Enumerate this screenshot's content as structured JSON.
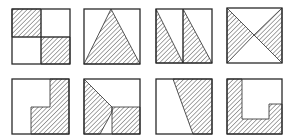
{
  "diagram": {
    "colors": {
      "stroke": "#2a2a2a",
      "hatch": "#3a3a3a",
      "background": "#ffffff"
    },
    "figures": [
      {
        "id": 1,
        "row": 1,
        "col": 1,
        "box": [
          12,
          9,
          58,
          55
        ],
        "shaded": [
          [
            [
              12,
              9
            ],
            [
              41,
              9
            ],
            [
              41,
              37
            ],
            [
              12,
              37
            ]
          ],
          [
            [
              41,
              37
            ],
            [
              70,
              37
            ],
            [
              70,
              64
            ],
            [
              41,
              64
            ]
          ]
        ],
        "lines": [
          [
            [
              41,
              9
            ],
            [
              41,
              64
            ]
          ],
          [
            [
              12,
              37
            ],
            [
              70,
              37
            ]
          ]
        ]
      },
      {
        "id": 2,
        "row": 1,
        "col": 2,
        "box": [
          84,
          9,
          56,
          55
        ],
        "shaded": [
          [
            [
              111,
              9
            ],
            [
              140,
              64
            ],
            [
              84,
              64
            ]
          ]
        ],
        "lines": []
      },
      {
        "id": 3,
        "row": 1,
        "col": 3,
        "box": [
          156,
          9,
          56,
          54
        ],
        "shaded": [
          [
            [
              156,
              9
            ],
            [
              183,
              63
            ],
            [
              156,
              63
            ]
          ],
          [
            [
              183,
              9
            ],
            [
              212,
              63
            ],
            [
              183,
              63
            ]
          ]
        ],
        "lines": [
          [
            [
              183,
              9
            ],
            [
              183,
              63
            ]
          ]
        ]
      },
      {
        "id": 4,
        "row": 1,
        "col": 4,
        "box": [
          227,
          8,
          55,
          55
        ],
        "shaded": [
          [
            [
              227,
              8
            ],
            [
              254,
              35
            ],
            [
              227,
              63
            ]
          ],
          [
            [
              282,
              8
            ],
            [
              282,
              63
            ],
            [
              254,
              35
            ]
          ]
        ],
        "lines": []
      },
      {
        "id": 5,
        "row": 2,
        "col": 1,
        "box": [
          12,
          79,
          57,
          55
        ],
        "shaded": [
          [
            [
              50,
              79
            ],
            [
              69,
              79
            ],
            [
              69,
              134
            ],
            [
              31,
              134
            ],
            [
              31,
              107
            ],
            [
              50,
              107
            ]
          ]
        ],
        "lines": []
      },
      {
        "id": 6,
        "row": 2,
        "col": 2,
        "box": [
          84,
          79,
          56,
          55
        ],
        "shaded": [
          [
            [
              84,
              79
            ],
            [
              112,
              107
            ],
            [
              112,
              112
            ],
            [
              100,
              134
            ],
            [
              84,
              134
            ]
          ],
          [
            [
              112,
              107
            ],
            [
              140,
              107
            ],
            [
              140,
              134
            ],
            [
              112,
              134
            ]
          ]
        ],
        "lines": []
      },
      {
        "id": 7,
        "row": 2,
        "col": 3,
        "box": [
          156,
          79,
          56,
          55
        ],
        "shaded": [
          [
            [
              173,
              79
            ],
            [
              212,
              79
            ],
            [
              212,
              134
            ],
            [
              193,
              134
            ]
          ]
        ],
        "lines": []
      },
      {
        "id": 8,
        "row": 2,
        "col": 4,
        "box": [
          227,
          79,
          55,
          55
        ],
        "shaded": [
          [
            [
              227,
              79
            ],
            [
              242,
              79
            ],
            [
              242,
              119
            ],
            [
              269,
              119
            ],
            [
              269,
              104
            ],
            [
              282,
              104
            ],
            [
              282,
              134
            ],
            [
              227,
              134
            ]
          ]
        ],
        "lines": []
      }
    ]
  }
}
